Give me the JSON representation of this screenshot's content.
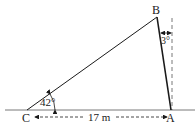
{
  "diagram": {
    "type": "triangle",
    "vertices": {
      "A": {
        "label": "A"
      },
      "B": {
        "label": "B"
      },
      "C": {
        "label": "C"
      }
    },
    "angles": {
      "C": "42°",
      "B_from_vertical": "3°"
    },
    "base_length": "17 m",
    "colors": {
      "line": "#1a1a1a",
      "dashed": "#555555",
      "background": "#ffffff"
    }
  }
}
